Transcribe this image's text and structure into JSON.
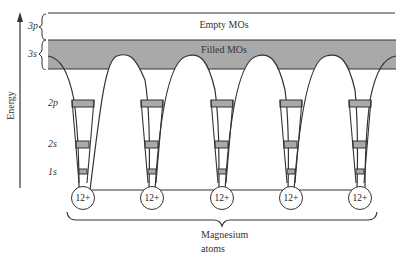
{
  "diagram": {
    "energy_axis_label": "Energy",
    "bands": {
      "empty": "Empty MOs",
      "filled": "Filled MOs"
    },
    "orbital_labels": {
      "p3": "3p",
      "s3": "3s",
      "p2": "2p",
      "s2": "2s",
      "s1": "1s"
    },
    "atoms": [
      {
        "label": "12+"
      },
      {
        "label": "12+"
      },
      {
        "label": "12+"
      },
      {
        "label": "12+"
      },
      {
        "label": "12+"
      }
    ],
    "caption_line1": "Magnesium",
    "caption_line2": "atoms",
    "colors": {
      "filled_band": "#a9a9a9",
      "line": "#333333",
      "background": "#ffffff"
    }
  }
}
